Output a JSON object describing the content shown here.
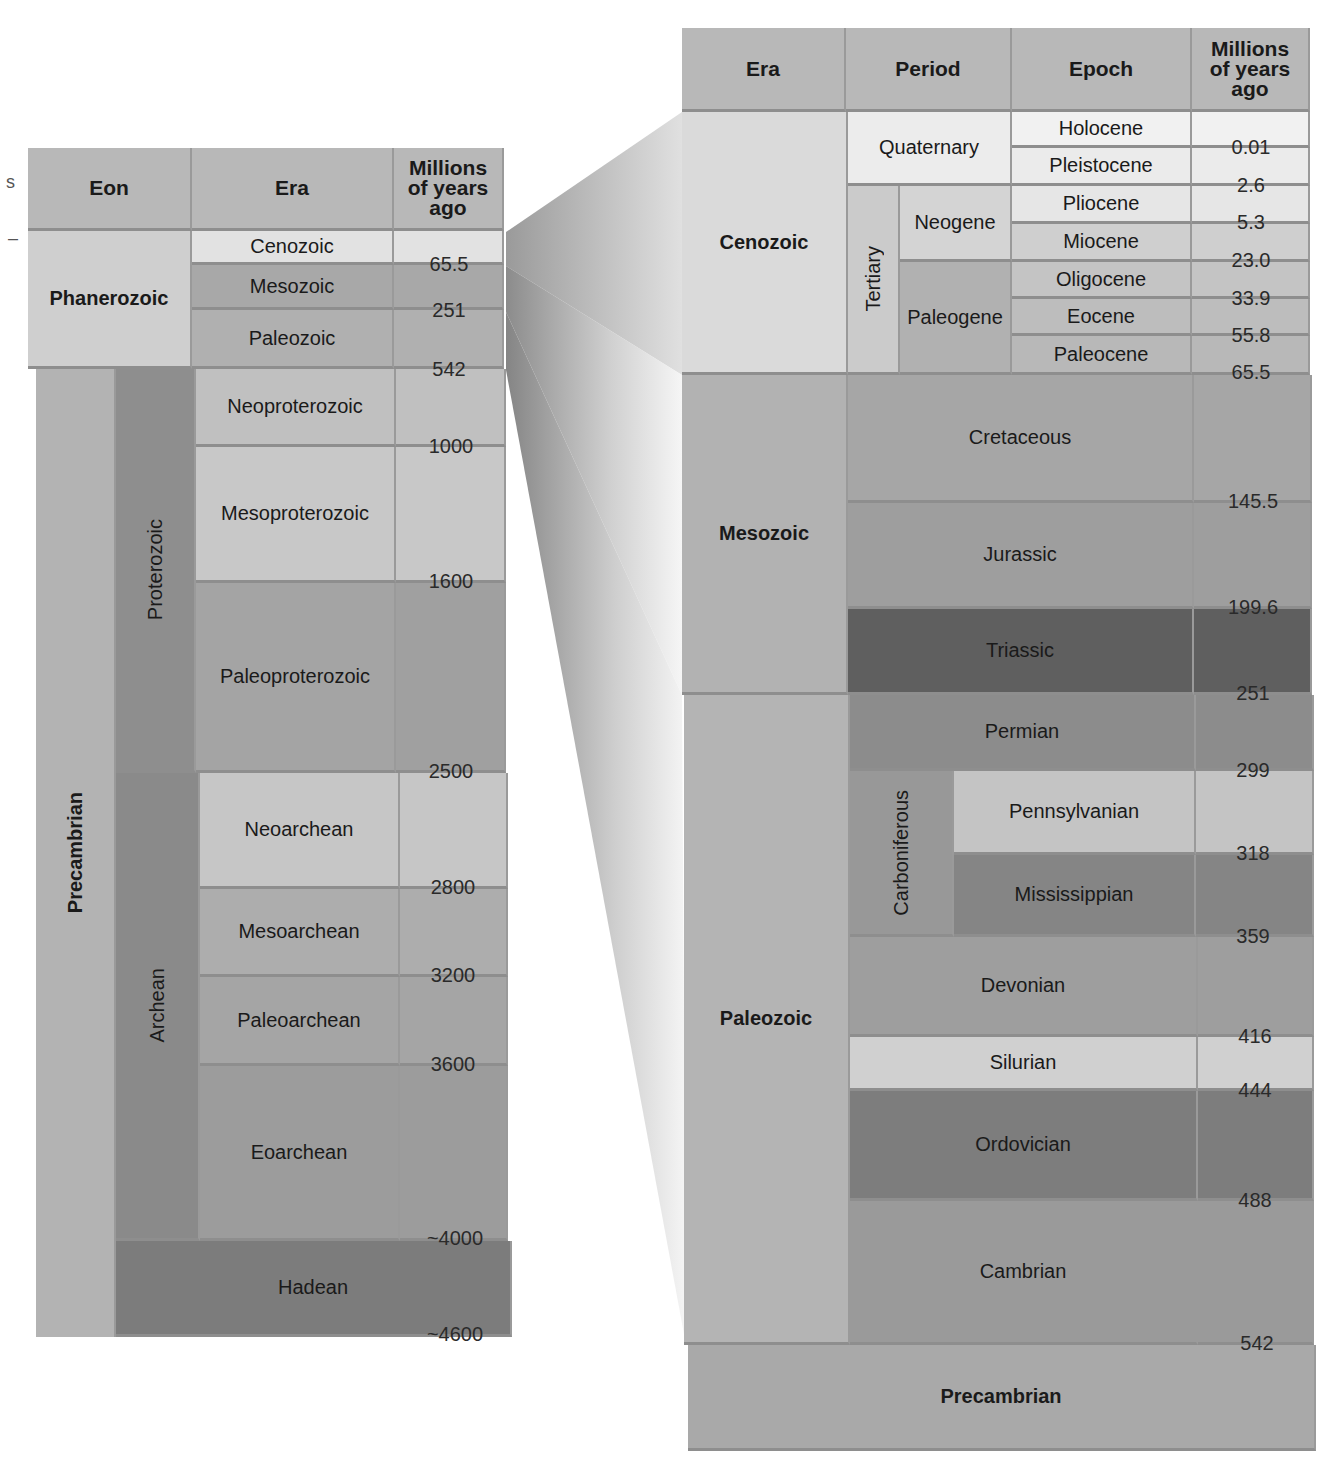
{
  "left_table": {
    "headers": {
      "eon": "Eon",
      "era": "Era",
      "mya": "Millions of years ago"
    },
    "eons": [
      {
        "name": "Phanerozoic"
      },
      {
        "name": "Precambrian"
      }
    ],
    "precambrian_subeons": [
      {
        "name": "Proterozoic"
      },
      {
        "name": "Archean"
      }
    ],
    "eras": [
      {
        "name": "Cenozoic"
      },
      {
        "name": "Mesozoic"
      },
      {
        "name": "Paleozoic"
      },
      {
        "name": "Neoproterozoic"
      },
      {
        "name": "Mesoproterozoic"
      },
      {
        "name": "Paleoproterozoic"
      },
      {
        "name": "Neoarchean"
      },
      {
        "name": "Mesoarchean"
      },
      {
        "name": "Paleoarchean"
      },
      {
        "name": "Eoarchean"
      },
      {
        "name": "Hadean"
      }
    ],
    "boundaries": [
      "65.5",
      "251",
      "542",
      "1000",
      "1600",
      "2500",
      "2800",
      "3200",
      "3600",
      "~4000",
      "~4600"
    ]
  },
  "right_table": {
    "headers": {
      "era": "Era",
      "period": "Period",
      "epoch": "Epoch",
      "mya": "Millions of years ago"
    },
    "eras": [
      {
        "name": "Cenozoic"
      },
      {
        "name": "Mesozoic"
      },
      {
        "name": "Paleozoic"
      },
      {
        "name": "Precambrian"
      }
    ],
    "cenozoic": {
      "quaternary": "Quaternary",
      "tertiary": "Tertiary",
      "neogene": "Neogene",
      "paleogene": "Paleogene",
      "epochs": [
        "Holocene",
        "Pleistocene",
        "Pliocene",
        "Miocene",
        "Oligocene",
        "Eocene",
        "Paleocene"
      ]
    },
    "periods": {
      "cretaceous": "Cretaceous",
      "jurassic": "Jurassic",
      "triassic": "Triassic",
      "permian": "Permian",
      "carboniferous": "Carboniferous",
      "pennsylvanian": "Pennsylvanian",
      "mississippian": "Mississippian",
      "devonian": "Devonian",
      "silurian": "Silurian",
      "ordovician": "Ordovician",
      "cambrian": "Cambrian"
    },
    "boundaries": [
      "0.01",
      "2.6",
      "5.3",
      "23.0",
      "33.9",
      "55.8",
      "65.5",
      "145.5",
      "199.6",
      "251",
      "299",
      "318",
      "359",
      "416",
      "444",
      "488",
      "542"
    ]
  },
  "edge_marks": [
    "s",
    "–"
  ],
  "colors": {
    "header": "#b5b5b5",
    "lightest": "#e8e8e8",
    "light": "#d2d2d2",
    "mid_light": "#c4c4c4",
    "mid": "#a9a9a9",
    "mid_dark": "#8f8f8f",
    "dark": "#7b7b7b",
    "darkest": "#5e5e5e"
  }
}
